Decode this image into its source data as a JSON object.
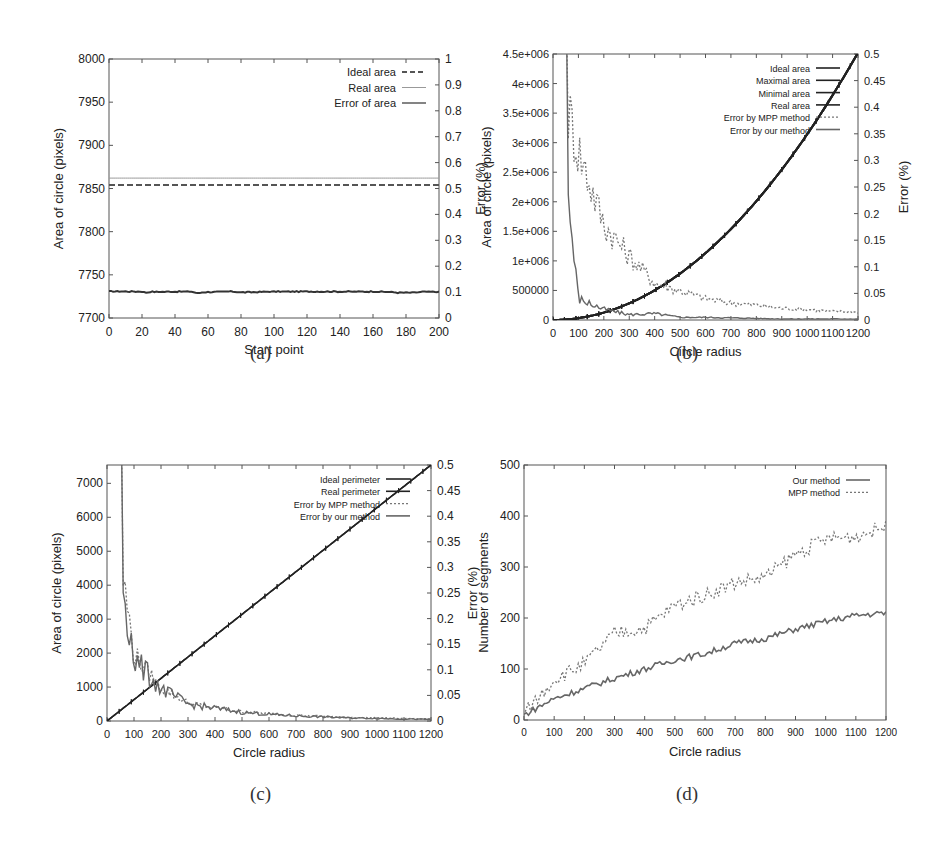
{
  "captions": {
    "a": "(a)",
    "b": "(b)",
    "c": "(c)",
    "d": "(d)"
  },
  "chart_data": [
    {
      "id": "a",
      "type": "line",
      "title": "",
      "xlabel": "Start point",
      "ylabel": "Area of circle (pixels)",
      "y2label": "Error (%)",
      "xlim": [
        0,
        200
      ],
      "ylim": [
        7700,
        8000
      ],
      "y2lim": [
        0,
        1
      ],
      "x_ticks": [
        "0",
        "20",
        "40",
        "60",
        "80",
        "100",
        "120",
        "140",
        "160",
        "180",
        "200"
      ],
      "y_ticks": [
        "7700",
        "7750",
        "7800",
        "7850",
        "7900",
        "7950",
        "8000"
      ],
      "y2_ticks": [
        "0",
        "0.1",
        "0.2",
        "0.3",
        "0.4",
        "0.5",
        "0.6",
        "0.7",
        "0.8",
        "0.9",
        "1"
      ],
      "legend": [
        "Ideal area",
        "Real area",
        "Error of area"
      ],
      "legend_position": "top-right",
      "grid": false,
      "x": [
        0,
        20,
        22,
        25,
        50,
        54,
        57,
        75,
        80,
        88,
        100,
        120,
        140,
        160,
        170,
        175,
        185,
        190,
        200
      ],
      "series": [
        {
          "name": "Ideal area",
          "axis": "left",
          "style": "dashed",
          "values": [
            7854,
            7854,
            7854,
            7854,
            7854,
            7854,
            7854,
            7854,
            7854,
            7854,
            7854,
            7854,
            7854,
            7854,
            7854,
            7854,
            7854,
            7854,
            7854
          ]
        },
        {
          "name": "Real area",
          "axis": "left",
          "style": "solid-thin",
          "values": [
            7862,
            7862,
            7862,
            7862,
            7862,
            7862,
            7862,
            7862,
            7862,
            7862,
            7862,
            7862,
            7862,
            7862,
            7862,
            7862,
            7862,
            7862,
            7862
          ]
        },
        {
          "name": "Error of area",
          "axis": "right",
          "style": "solid-thick",
          "values": [
            0.103,
            0.102,
            0.098,
            0.101,
            0.102,
            0.095,
            0.1,
            0.102,
            0.099,
            0.1,
            0.102,
            0.102,
            0.102,
            0.102,
            0.101,
            0.098,
            0.098,
            0.101,
            0.101
          ]
        }
      ]
    },
    {
      "id": "b",
      "type": "line",
      "title": "",
      "xlabel": "Circle radius",
      "ylabel": "Area of circle (pixels)",
      "y2label": "Error (%)",
      "xlim": [
        0,
        1200
      ],
      "ylim": [
        0,
        4500000
      ],
      "y2lim": [
        0,
        0.5
      ],
      "x_ticks": [
        "0",
        "100",
        "200",
        "300",
        "400",
        "500",
        "600",
        "700",
        "800",
        "900",
        "1000",
        "1100",
        "1200"
      ],
      "y_ticks": [
        "0",
        "500000",
        "1e+006",
        "1.5e+006",
        "2e+006",
        "2.5e+006",
        "3e+006",
        "3.5e+006",
        "4e+006",
        "4.5e+006"
      ],
      "y2_ticks": [
        "0",
        "0.05",
        "0.1",
        "0.15",
        "0.2",
        "0.25",
        "0.3",
        "0.35",
        "0.4",
        "0.45",
        "0.5"
      ],
      "legend": [
        "Ideal area",
        "Maximal area",
        "Minimal area",
        "Real area",
        "Error by MPP method",
        "Error by our method"
      ],
      "legend_position": "top-right",
      "grid": false,
      "x": [
        0,
        100,
        200,
        300,
        400,
        500,
        600,
        700,
        800,
        900,
        1000,
        1100,
        1200
      ],
      "series": [
        {
          "name": "Ideal area",
          "axis": "left",
          "values": [
            0,
            31416,
            125664,
            282743,
            502655,
            785398,
            1130973,
            1539380,
            2010619,
            2544690,
            3141593,
            3801327,
            4523893
          ]
        },
        {
          "name": "Maximal area",
          "axis": "left",
          "values": [
            0,
            31500,
            125800,
            282900,
            502900,
            785600,
            1131200,
            1539600,
            2010900,
            2545000,
            3141900,
            3801600,
            4524200
          ]
        },
        {
          "name": "Minimal area",
          "axis": "left",
          "values": [
            0,
            31300,
            125500,
            282600,
            502400,
            785200,
            1130700,
            1539100,
            2010300,
            2544400,
            3141300,
            3801000,
            4523600
          ]
        },
        {
          "name": "Real area",
          "axis": "left",
          "values": [
            0,
            31420,
            125670,
            282750,
            502660,
            785400,
            1130980,
            1539390,
            2010620,
            2544700,
            3141600,
            3801330,
            4523900
          ]
        },
        {
          "name": "Error by MPP method",
          "axis": "right",
          "style": "dotted",
          "values": [
            0.5,
            0.32,
            0.18,
            0.12,
            0.07,
            0.055,
            0.04,
            0.032,
            0.028,
            0.022,
            0.02,
            0.016,
            0.015
          ]
        },
        {
          "name": "Error by our method",
          "axis": "right",
          "style": "solid",
          "values": [
            0.5,
            0.04,
            0.02,
            0.01,
            0.012,
            0.005,
            0.005,
            0.004,
            0.003,
            0.002,
            0.002,
            0.002,
            0.002
          ]
        }
      ]
    },
    {
      "id": "c",
      "type": "line",
      "title": "",
      "xlabel": "Circle radius",
      "ylabel": "Area of circle (pixels)",
      "y2label": "Error (%)",
      "xlim": [
        0,
        1200
      ],
      "ylim": [
        0,
        7540
      ],
      "y2lim": [
        0,
        0.5
      ],
      "x_ticks": [
        "0",
        "100",
        "200",
        "300",
        "400",
        "500",
        "600",
        "700",
        "800",
        "900",
        "1000",
        "1100",
        "1200"
      ],
      "y_ticks": [
        "0",
        "1000",
        "2000",
        "3000",
        "4000",
        "5000",
        "6000",
        "7000"
      ],
      "y2_ticks": [
        "0",
        "0.05",
        "0.1",
        "0.15",
        "0.2",
        "0.25",
        "0.3",
        "0.35",
        "0.4",
        "0.45",
        "0.5"
      ],
      "legend": [
        "Ideal perimeter",
        "Real perimeter",
        "Error by MPP method",
        "Error by our method"
      ],
      "legend_position": "top-right",
      "grid": false,
      "x": [
        0,
        100,
        200,
        300,
        400,
        500,
        600,
        700,
        800,
        900,
        1000,
        1100,
        1200
      ],
      "series": [
        {
          "name": "Ideal perimeter",
          "axis": "left",
          "values": [
            0,
            628,
            1257,
            1885,
            2513,
            3142,
            3770,
            4398,
            5027,
            5655,
            6283,
            6912,
            7540
          ]
        },
        {
          "name": "Real perimeter",
          "axis": "left",
          "values": [
            0,
            628,
            1257,
            1885,
            2513,
            3142,
            3770,
            4398,
            5027,
            5655,
            6283,
            6912,
            7540
          ]
        },
        {
          "name": "Error by MPP method",
          "axis": "right",
          "style": "dotted",
          "values": [
            0.5,
            0.13,
            0.065,
            0.035,
            0.026,
            0.018,
            0.014,
            0.011,
            0.009,
            0.007,
            0.006,
            0.005,
            0.004
          ]
        },
        {
          "name": "Error by our method",
          "axis": "right",
          "style": "solid",
          "values": [
            0.5,
            0.12,
            0.063,
            0.033,
            0.025,
            0.017,
            0.013,
            0.01,
            0.008,
            0.006,
            0.005,
            0.004,
            0.003
          ]
        }
      ]
    },
    {
      "id": "d",
      "type": "line",
      "title": "",
      "xlabel": "Circle radius",
      "ylabel": "Number of segments",
      "xlim": [
        0,
        1200
      ],
      "ylim": [
        0,
        500
      ],
      "x_ticks": [
        "0",
        "100",
        "200",
        "300",
        "400",
        "500",
        "600",
        "700",
        "800",
        "900",
        "1000",
        "1100",
        "1200"
      ],
      "y_ticks": [
        "0",
        "100",
        "200",
        "300",
        "400",
        "500"
      ],
      "legend": [
        "Our method",
        "MPP method"
      ],
      "legend_position": "top-right",
      "grid": false,
      "x": [
        0,
        100,
        200,
        300,
        400,
        500,
        600,
        700,
        800,
        900,
        1000,
        1100,
        1200
      ],
      "series": [
        {
          "name": "Our method",
          "style": "solid",
          "values": [
            10,
            42,
            62,
            82,
            100,
            118,
            130,
            150,
            160,
            178,
            193,
            205,
            210
          ]
        },
        {
          "name": "MPP method",
          "style": "dotted",
          "values": [
            12,
            80,
            110,
            170,
            180,
            225,
            245,
            270,
            280,
            325,
            355,
            360,
            380
          ]
        }
      ]
    }
  ]
}
